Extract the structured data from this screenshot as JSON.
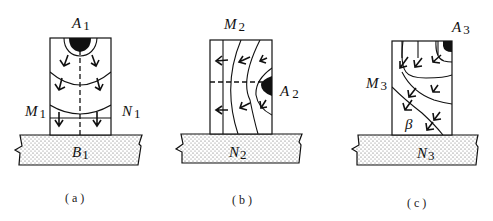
{
  "figure": {
    "type": "welding heat flow / crystal growth direction schematic",
    "panels": [
      {
        "id": "a",
        "caption": "( a )",
        "labels": {
          "heat_source": {
            "letter": "A",
            "index": "1"
          },
          "left": {
            "letter": "M",
            "index": "1"
          },
          "right": {
            "letter": "N",
            "index": "1"
          },
          "base": {
            "letter": "B",
            "index": "1"
          }
        },
        "heat_source_position": "top-center",
        "centerline": "vertical dashed",
        "isotherms": 3,
        "arrows_direction": "downward"
      },
      {
        "id": "b",
        "caption": "( b )",
        "labels": {
          "top": {
            "letter": "M",
            "index": "2"
          },
          "heat_source": {
            "letter": "A",
            "index": "2"
          },
          "base": {
            "letter": "N",
            "index": "2"
          }
        },
        "heat_source_position": "right-middle",
        "centerline": "horizontal dashed",
        "isotherms": 3,
        "arrows_direction": "leftward"
      },
      {
        "id": "c",
        "caption": "( c )",
        "labels": {
          "heat_source": {
            "letter": "A",
            "index": "3"
          },
          "left": {
            "letter": "M",
            "index": "3"
          },
          "angle": "β",
          "base": {
            "letter": "N",
            "index": "3"
          }
        },
        "heat_source_position": "top-right corner",
        "isotherms": 3,
        "arrows_direction": "diagonal down-left"
      }
    ]
  }
}
